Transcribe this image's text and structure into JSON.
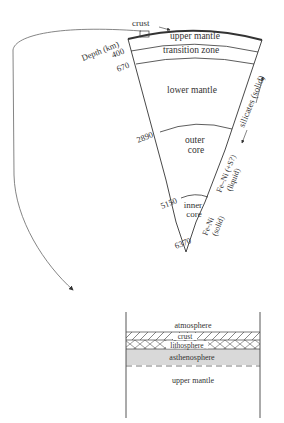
{
  "earth_section": {
    "crust_label": "crust",
    "depth_axis_label": "Depth (km)",
    "depth_ticks": [
      "400",
      "670",
      "2890",
      "5150",
      "6370"
    ],
    "layers": {
      "upper_mantle": "upper mantle",
      "transition_zone": "transition zone",
      "lower_mantle": "lower mantle",
      "outer_core_line1": "outer",
      "outer_core_line2": "core",
      "inner_core_line1": "inner",
      "inner_core_line2": "core"
    },
    "compositions": {
      "silicates": "silicates (solid)",
      "outer_core_comp_line1": "Fe–Ni (+S?)",
      "outer_core_comp_line2": "(liquid)",
      "inner_core_comp_line1": "Fe-Ni",
      "inner_core_comp_line2": "(solid)"
    }
  },
  "detail_box": {
    "layers": [
      "atmosphere",
      "crust",
      "lithosphere",
      "asthenosphere",
      "upper mantle"
    ]
  },
  "colors": {
    "line": "#333333",
    "asthenosphere_fill": "#d9d9d9",
    "background": "#ffffff"
  }
}
